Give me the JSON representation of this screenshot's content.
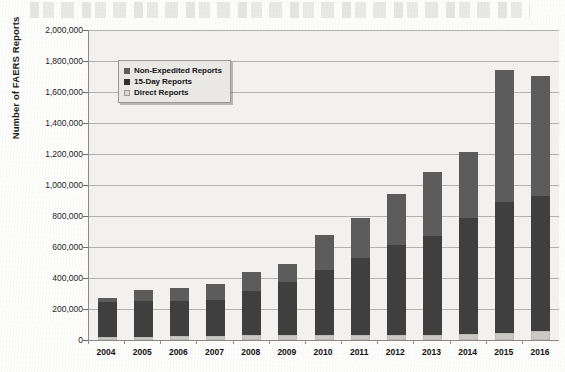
{
  "chart_data": {
    "type": "bar",
    "subtype": "stacked-bar",
    "title": "",
    "xlabel": "",
    "ylabel": "Number of FAERS Reports",
    "categories": [
      "2004",
      "2005",
      "2006",
      "2007",
      "2008",
      "2009",
      "2010",
      "2011",
      "2012",
      "2013",
      "2014",
      "2015",
      "2016"
    ],
    "series": [
      {
        "name": "Direct  Reports",
        "color": "#c9c8c4",
        "values": [
          20000,
          22000,
          24000,
          26000,
          30000,
          32000,
          30000,
          32000,
          34000,
          34000,
          38000,
          48000,
          55000
        ]
      },
      {
        "name": "15-Day Reports",
        "color": "#3f3f3f",
        "values": [
          225000,
          230000,
          226000,
          232000,
          285000,
          340000,
          420000,
          500000,
          580000,
          640000,
          752000,
          840000,
          875000
        ]
      },
      {
        "name": "Non-Expedited Reports",
        "color": "#5c5c5c",
        "values": [
          25000,
          68000,
          85000,
          102000,
          125000,
          118000,
          225000,
          253000,
          326000,
          411000,
          425000,
          852000,
          775000
        ]
      }
    ],
    "totals": [
      270000,
      320000,
      335000,
      360000,
      440000,
      490000,
      675000,
      785000,
      940000,
      1085000,
      1215000,
      1740000,
      1705000
    ],
    "ylim": [
      0,
      2000000
    ],
    "ytick_step": 200000,
    "ytick_labels": [
      "2,000,000",
      "1,800,000",
      "1,600,000",
      "1,400,000",
      "1,200,000",
      "1,000,000",
      "800,000",
      "600,000",
      "400,000",
      "200,000",
      "0"
    ],
    "ytick_values": [
      2000000,
      1800000,
      1600000,
      1400000,
      1200000,
      1000000,
      800000,
      600000,
      400000,
      200000,
      0
    ],
    "grid": true,
    "legend_position": "top-left-inside",
    "legend_order": [
      "Non-Expedited Reports",
      "15-Day Reports",
      "Direct  Reports"
    ],
    "plot_background": "#f2f1ef"
  },
  "legend": {
    "entries": [
      {
        "label": "Non-Expedited Reports",
        "swatch": "non-expedited-swatch"
      },
      {
        "label": "15-Day Reports",
        "swatch": "fifteen-day-swatch"
      },
      {
        "label": "Direct  Reports",
        "swatch": "direct-swatch"
      }
    ]
  },
  "axes": {
    "y_title": "Number of FAERS Reports"
  }
}
